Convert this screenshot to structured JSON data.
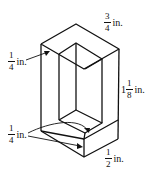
{
  "figure": {
    "stroke_color": "#111111"
  },
  "labels": {
    "top_width": {
      "num": "3",
      "den": "4",
      "unit": "in."
    },
    "left_wall": {
      "num": "1",
      "den": "4",
      "unit": "in."
    },
    "height": {
      "whole": "1",
      "num": "1",
      "den": "8",
      "unit": "in."
    },
    "bottom_wall": {
      "num": "1",
      "den": "4",
      "unit": "in."
    },
    "front_width": {
      "num": "1",
      "den": "2",
      "unit": "in."
    }
  }
}
